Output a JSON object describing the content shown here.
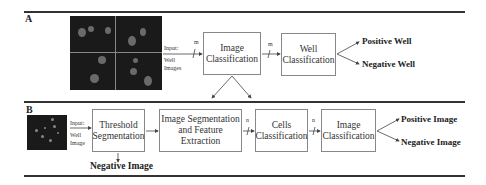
{
  "panel_a": {
    "label": "A",
    "input_label_1": "Input:",
    "input_label_2": "Well",
    "input_label_3": "Images",
    "arrow_1_label": "m",
    "arrow_2_label": "m",
    "box_1": {
      "line1": "Image",
      "line2": "Classification"
    },
    "box_2": {
      "line1": "Well",
      "line2": "Classification"
    },
    "outputs": [
      "Positive Well",
      "Negative Well"
    ]
  },
  "panel_b": {
    "label": "B",
    "input_label_1": "Input:",
    "input_label_2": "Well",
    "input_label_3": "Image",
    "box_1": {
      "line1": "Threshold",
      "line2": "Segmentation"
    },
    "box_2": {
      "line1": "Image Segmentation",
      "line2": "and Feature Extraction"
    },
    "box_3": {
      "line1": "Cells",
      "line2": "Classification"
    },
    "box_4": {
      "line1": "Image",
      "line2": "Classification"
    },
    "arrow_3_label": "n",
    "arrow_4_label": "n",
    "negative_output": "Negative Image",
    "outputs": [
      "Positive Image",
      "Negative Image"
    ]
  }
}
